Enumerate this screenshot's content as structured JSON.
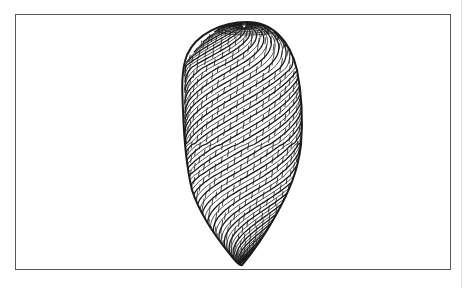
{
  "figure": {
    "colors": {
      "background": "#ffffff",
      "frame": "#5a5a5a",
      "mesh": "#1a1a1a",
      "edge_line": "#e2e2e2"
    },
    "shape": {
      "top": [
        247,
        22
      ],
      "bottom_tip": [
        241,
        265
      ],
      "left_extent_x": 183,
      "right_extent_x": 301,
      "spiral_bands": 22,
      "rings": 34
    }
  }
}
